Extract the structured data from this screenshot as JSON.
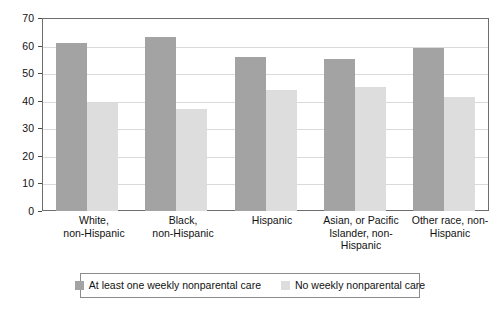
{
  "chart_data": {
    "type": "bar",
    "title": "",
    "subtitle": "",
    "xlabel": "",
    "ylabel": "",
    "ylim": [
      0,
      70
    ],
    "ytick_step": 10,
    "yticks": [
      "0",
      "10",
      "20",
      "30",
      "40",
      "50",
      "60",
      "70"
    ],
    "grid": true,
    "legend_position": "bottom",
    "categories": [
      "White,\nnon-Hispanic",
      "Black,\nnon-Hispanic",
      "Hispanic",
      "Asian, or Pacific\nIslander, non-\nHispanic",
      "Other race, non-\nHispanic"
    ],
    "category_lines": [
      [
        "White,",
        "non-Hispanic"
      ],
      [
        "Black,",
        "non-Hispanic"
      ],
      [
        "Hispanic"
      ],
      [
        "Asian, or Pacific",
        "Islander, non-",
        "Hispanic"
      ],
      [
        "Other race, non-",
        "Hispanic"
      ]
    ],
    "series": [
      {
        "name": "At least one weekly nonparental care",
        "color": "#a3a3a3",
        "values": [
          61,
          63,
          56,
          55,
          59
        ]
      },
      {
        "name": "No weekly nonparental care",
        "color": "#dddddd",
        "values": [
          39,
          37,
          44,
          45,
          41.5
        ]
      }
    ]
  },
  "colors": {
    "series_0": "#a3a3a3",
    "series_1": "#dddddd",
    "gridline": "#dadada",
    "frame": "#6e6e6e",
    "legend_border": "#8c8c8c",
    "text": "#111111",
    "background": "#ffffff"
  }
}
